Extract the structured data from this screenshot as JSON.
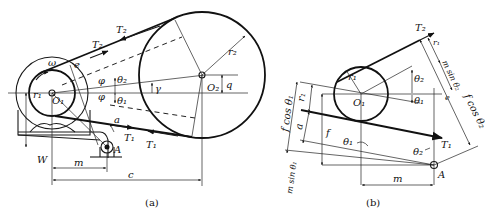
{
  "figure_a": {
    "caption": "(a)",
    "labels": {
      "T2_upper": "T₂",
      "T2_left": "T₂",
      "omega": "ω",
      "e": "e",
      "phi_upper": "φ",
      "phi_lower": "φ",
      "theta2": "θ₂",
      "theta1": "θ₁",
      "gamma": "γ",
      "r1": "r₁",
      "O1": "O₁",
      "O2": "O₂",
      "q": "q",
      "r2": "r₂",
      "a": "a",
      "T1_right": "T₁",
      "T1_left": "T₁",
      "A": "A",
      "W": "W",
      "m": "m",
      "c": "c"
    }
  },
  "figure_b": {
    "caption": "(b)",
    "labels": {
      "T2": "T₂",
      "r1_top": "r₁",
      "m_sin_theta2": "m sin θ₂",
      "r1_circle": "r₁",
      "theta2": "θ₂",
      "O1": "O₁",
      "theta1": "θ₁",
      "e": "e",
      "f_cos_theta2": "f cos θ₂",
      "f_cos_theta1": "f cos θ₁",
      "r1_left": "r₁",
      "a": "a",
      "f": "f",
      "theta1_lower": "θ₁",
      "theta2_lower": "θ₂",
      "T1": "T₁",
      "m_sin_theta1": "m sin θ₁",
      "A": "A",
      "m": "m"
    }
  }
}
